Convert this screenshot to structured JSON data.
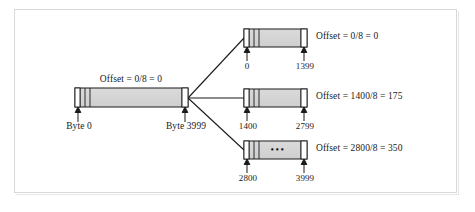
{
  "figure": {
    "type": "memory-segmentation-diagram",
    "border_color": "#d8d8d8",
    "bar_fill": "#d4d4d4",
    "bar_stroke": "#1a1a1a",
    "line_color": "#1a1a1a"
  },
  "main_bar": {
    "name": "main-buffer",
    "offset_label": "Offset = 0/8 = 0",
    "start_label": "Byte 0",
    "end_label": "Byte 3999",
    "segments": 4
  },
  "blocks": [
    {
      "id": "block-top",
      "offset_label": "Offset = 0/8 = 0",
      "start_label": "0",
      "end_label": "1399",
      "ellipsis": "",
      "segments": 4
    },
    {
      "id": "block-middle",
      "offset_label": "Offset = 1400/8 = 175",
      "start_label": "1400",
      "end_label": "2799",
      "ellipsis": "",
      "segments": 4
    },
    {
      "id": "block-bottom",
      "offset_label": "Offset = 2800/8 = 350",
      "start_label": "2800",
      "end_label": "3999",
      "ellipsis": "•••",
      "segments": 4
    }
  ]
}
